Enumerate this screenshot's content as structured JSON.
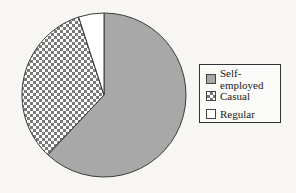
{
  "chart_data": {
    "type": "pie",
    "title": "",
    "categories": [
      "Self-employed",
      "Casual",
      "Regular"
    ],
    "values": [
      62,
      33,
      5
    ],
    "unit": "%",
    "start_angle": "12 o'clock, clockwise: Self-employed, then Casual, then Regular",
    "legend_position": "right",
    "fills": {
      "Self-employed": "solid grey #a8a8a8",
      "Casual": "grey/white checkerboard",
      "Regular": "white"
    }
  },
  "legend": {
    "items": [
      {
        "label": "Self-employed",
        "fill": "solid"
      },
      {
        "label": "Casual",
        "fill": "checker"
      },
      {
        "label": "Regular",
        "fill": "empty"
      }
    ]
  },
  "colors": {
    "grey": "#a8a8a8",
    "checker_dark": "#777777",
    "outline": "#333333",
    "background": "#f7f6f3"
  }
}
